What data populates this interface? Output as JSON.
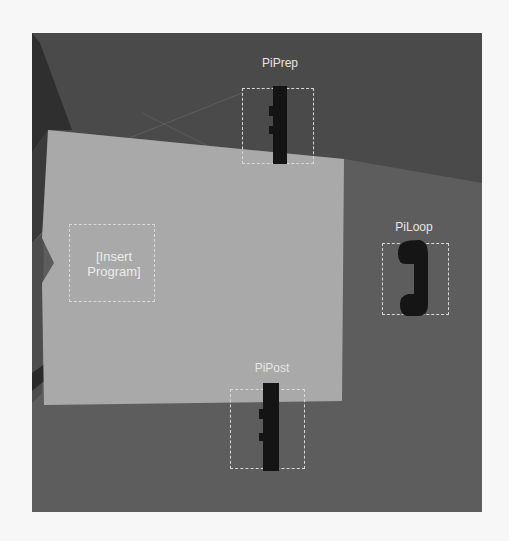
{
  "scene": {
    "colors": {
      "page_bg": "#f7f7f7",
      "floor_upper": "#4a4a4a",
      "floor_lower": "#5e5e5e",
      "panel": "#a8a8a8",
      "wall_left": "#333333",
      "dashed_border": "#d8d8d8",
      "label_text": "#e6e6e6",
      "phone": "#161616"
    }
  },
  "program_slot": {
    "text": "[Insert Program]",
    "line1": "[Insert",
    "line2": "Program]"
  },
  "slots": [
    {
      "id": "prep",
      "label": "PiPrep",
      "icon": "phone-handset-icon"
    },
    {
      "id": "loop",
      "label": "PiLoop",
      "icon": "phone-handset-icon"
    },
    {
      "id": "post",
      "label": "PiPost",
      "icon": "phone-handset-icon"
    }
  ]
}
